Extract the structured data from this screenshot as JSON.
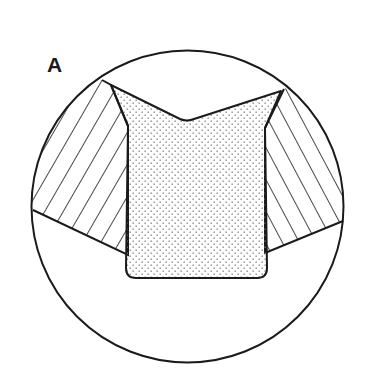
{
  "figure": {
    "panel_label": "A",
    "colors": {
      "line": "#1a1a1a",
      "background": "#ffffff",
      "stipple_dot": "#8a8a8a"
    },
    "circle": {
      "cx": 187.5,
      "cy": 206.5,
      "r": 156
    },
    "regions": [
      {
        "name": "left-hatched-region",
        "fill": "diagonal-hatch-up-right"
      },
      {
        "name": "right-hatched-region",
        "fill": "diagonal-hatch-down-right"
      },
      {
        "name": "central-stippled-shape",
        "fill": "stipple-dots"
      }
    ]
  }
}
